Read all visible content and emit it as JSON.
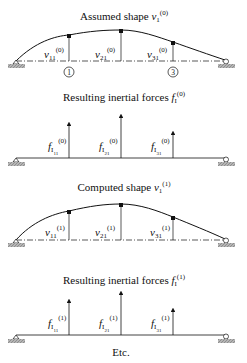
{
  "panels": [
    {
      "id": "assumed-shape",
      "title_text": "Assumed shape ",
      "title_symbol": "v",
      "title_sub": "1",
      "title_sup": "(0)",
      "type": "deflected-shape",
      "labels": [
        {
          "sym": "v",
          "sub": "11",
          "sup": "(0)"
        },
        {
          "sym": "v",
          "sub": "21",
          "sup": "(0)"
        },
        {
          "sym": "v",
          "sub": "31",
          "sup": "(0)"
        }
      ],
      "node_markers": [
        "1",
        "3"
      ]
    },
    {
      "id": "inertial-forces-0",
      "title_text": "Resulting inertial forces ",
      "title_symbol": "f",
      "title_sub": "I",
      "title_sup": "(0)",
      "type": "force-arrows",
      "labels": [
        {
          "sym": "f",
          "sub": "I",
          "subsub": "11",
          "sup": "(0)"
        },
        {
          "sym": "f",
          "sub": "I",
          "subsub": "21",
          "sup": "(0)"
        },
        {
          "sym": "f",
          "sub": "I",
          "subsub": "31",
          "sup": "(0)"
        }
      ]
    },
    {
      "id": "computed-shape",
      "title_text": "Computed shape ",
      "title_symbol": "v",
      "title_sub": "1",
      "title_sup": "(1)",
      "type": "deflected-shape",
      "labels": [
        {
          "sym": "v",
          "sub": "11",
          "sup": "(1)"
        },
        {
          "sym": "v",
          "sub": "21",
          "sup": "(1)"
        },
        {
          "sym": "v",
          "sub": "31",
          "sup": "(1)"
        }
      ]
    },
    {
      "id": "inertial-forces-1",
      "title_text": "Resulting inertial forces ",
      "title_symbol": "f",
      "title_sub": "I",
      "title_sup": "(1)",
      "type": "force-arrows",
      "labels": [
        {
          "sym": "f",
          "sub": "I",
          "subsub": "11",
          "sup": "(1)"
        },
        {
          "sym": "f",
          "sub": "I",
          "subsub": "21",
          "sup": "(1)"
        },
        {
          "sym": "f",
          "sub": "I",
          "subsub": "31",
          "sup": "(1)"
        }
      ]
    }
  ],
  "footer": "Etc.",
  "colors": {
    "ink": "#111111",
    "ground": "#9a9a9a"
  }
}
